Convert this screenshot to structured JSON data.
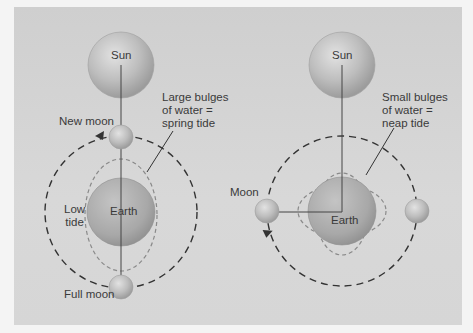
{
  "diagram": {
    "left_panel": {
      "name": "spring-tide",
      "sun_label": "Sun",
      "new_moon_label": "New moon",
      "full_moon_label": "Full moon",
      "earth_label": "Earth",
      "low_tide_label": "Low\ntide",
      "annotation": "Large bulges\nof water =\nspring tide"
    },
    "right_panel": {
      "name": "neap-tide",
      "sun_label": "Sun",
      "moon_label": "Moon",
      "earth_label": "Earth",
      "annotation": "Small bulges\nof water =\nneap tide"
    },
    "colors": {
      "background": "#d4d4d4",
      "body_fill": "#b8b8b8",
      "text": "#3a3a3a",
      "orbit_line": "#333333",
      "bulge_line": "#8a8a8a"
    }
  }
}
